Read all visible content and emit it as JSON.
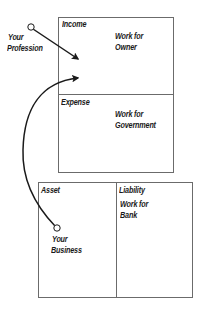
{
  "diagram": {
    "top_box": {
      "income": {
        "title": "Income",
        "note_line1": "Work for",
        "note_line2": "Owner"
      },
      "expense": {
        "title": "Expense",
        "note_line1": "Work for",
        "note_line2": "Government"
      }
    },
    "bottom_box": {
      "asset": {
        "title": "Asset"
      },
      "liability": {
        "title": "Liability",
        "note_line1": "Work for",
        "note_line2": "Bank"
      }
    },
    "sources": {
      "profession": {
        "line1": "Your",
        "line2": "Profession"
      },
      "business": {
        "line1": "Your",
        "line2": "Business"
      }
    },
    "colors": {
      "line": "#1a1a1a",
      "border": "#6b6b6b",
      "background": "#ffffff"
    }
  }
}
